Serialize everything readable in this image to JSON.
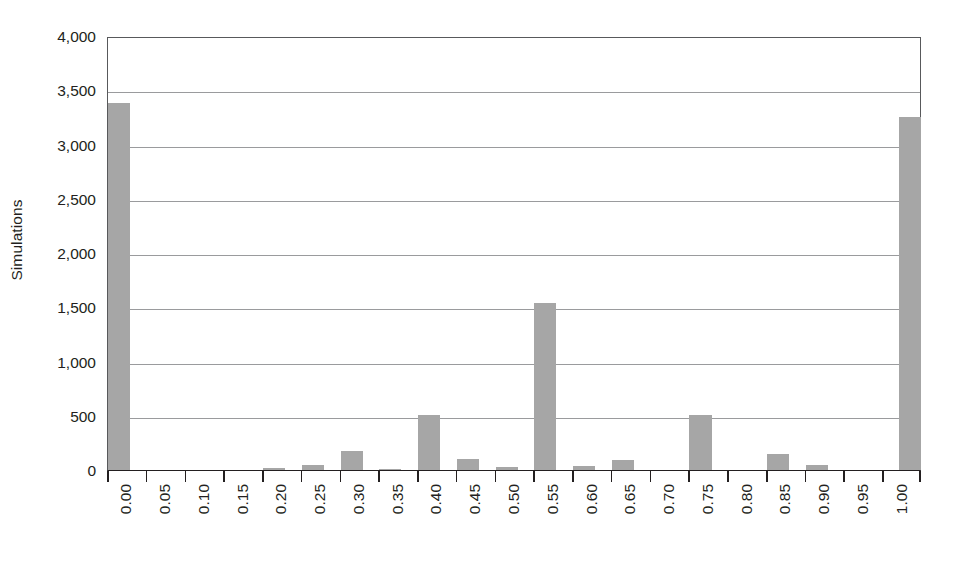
{
  "chart_data": {
    "type": "bar",
    "title": "",
    "xlabel": "",
    "ylabel": "Simulations",
    "ylim": [
      0,
      4000
    ],
    "ytick_labels": [
      "0",
      "500",
      "1,000",
      "1,500",
      "2,000",
      "2,500",
      "3,000",
      "3,500",
      "4,000"
    ],
    "ytick_values": [
      0,
      500,
      1000,
      1500,
      2000,
      2500,
      3000,
      3500,
      4000
    ],
    "grid": "horizontal",
    "legend": "none",
    "bar_color": "#a6a6a6",
    "axis_color": "#231f20",
    "gridline_color": "#9a9b9d",
    "categories": [
      "0.00",
      "0.05",
      "0.10",
      "0.15",
      "0.20",
      "0.25",
      "0.30",
      "0.35",
      "0.40",
      "0.45",
      "0.50",
      "0.55",
      "0.60",
      "0.65",
      "0.70",
      "0.75",
      "0.80",
      "0.85",
      "0.90",
      "0.95",
      "1.00"
    ],
    "values": [
      3380,
      0,
      0,
      0,
      20,
      50,
      175,
      10,
      505,
      105,
      25,
      1540,
      35,
      95,
      0,
      510,
      0,
      150,
      45,
      0,
      3250
    ]
  }
}
